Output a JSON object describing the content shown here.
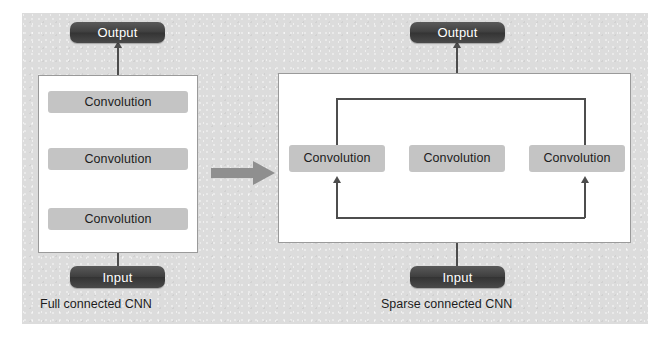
{
  "figure": {
    "background_color": "#dcdcdc",
    "panel_color": "#ffffff",
    "pill_color": "#3f3f3f",
    "conv_color": "#c4c4c4",
    "line_color": "#4d4d4d"
  },
  "left_diagram": {
    "caption": "Full connected CNN",
    "output_label": "Output",
    "input_label": "Input",
    "layers": [
      {
        "label": "Convolution"
      },
      {
        "label": "Convolution"
      },
      {
        "label": "Convolution"
      }
    ]
  },
  "transform_arrow": {
    "icon": "right-block-arrow",
    "color": "#8f8f8f"
  },
  "right_diagram": {
    "caption": "Sparse connected CNN",
    "output_label": "Output",
    "input_label": "Input",
    "layers": [
      {
        "label": "Convolution"
      },
      {
        "label": "Convolution"
      },
      {
        "label": "Convolution"
      }
    ]
  }
}
